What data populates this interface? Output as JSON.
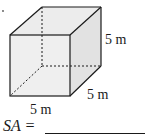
{
  "figure": {
    "shape": "cube",
    "fill_color": "#e8e8e8",
    "edge_color": "#1a1a1a",
    "hidden_edges": "dotted"
  },
  "labels": {
    "height": "5 m",
    "depth": "5 m",
    "width": "5 m"
  },
  "question": {
    "prompt": "SA =",
    "answer": ""
  }
}
